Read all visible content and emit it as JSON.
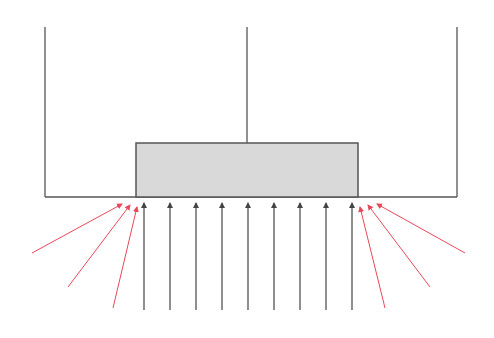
{
  "diagram": {
    "colors": {
      "background": "#ffffff",
      "structure": "#555555",
      "block_fill": "#d9d9d9",
      "block_stroke": "#555555",
      "vertical_arrow": "#444444",
      "oblique_arrow": "#e8485a"
    },
    "container": {
      "left_wall": {
        "x": 45,
        "y1": 27,
        "y2": 197
      },
      "right_wall": {
        "x": 457,
        "y1": 27,
        "y2": 197
      },
      "center_line": {
        "x": 247,
        "y1": 27,
        "y2": 143
      },
      "base": {
        "x1": 45,
        "x2": 457,
        "y": 197
      }
    },
    "block": {
      "x": 136,
      "y": 143,
      "width": 222,
      "height": 54
    },
    "vertical_arrows": [
      {
        "x": 144,
        "y_start": 310,
        "y_tip": 203
      },
      {
        "x": 170,
        "y_start": 310,
        "y_tip": 203
      },
      {
        "x": 196,
        "y_start": 310,
        "y_tip": 203
      },
      {
        "x": 222,
        "y_start": 310,
        "y_tip": 203
      },
      {
        "x": 248,
        "y_start": 310,
        "y_tip": 203
      },
      {
        "x": 274,
        "y_start": 310,
        "y_tip": 203
      },
      {
        "x": 300,
        "y_start": 310,
        "y_tip": 203
      },
      {
        "x": 326,
        "y_start": 310,
        "y_tip": 203
      },
      {
        "x": 352,
        "y_start": 310,
        "y_tip": 203
      }
    ],
    "oblique_arrows_left": [
      {
        "x1": 32,
        "y1": 253,
        "x2": 122,
        "y2": 204
      },
      {
        "x1": 68,
        "y1": 287,
        "x2": 130,
        "y2": 205
      },
      {
        "x1": 113,
        "y1": 308,
        "x2": 137,
        "y2": 207
      }
    ],
    "oblique_arrows_right": [
      {
        "x1": 385,
        "y1": 308,
        "x2": 360,
        "y2": 207
      },
      {
        "x1": 430,
        "y1": 287,
        "x2": 368,
        "y2": 205
      },
      {
        "x1": 465,
        "y1": 253,
        "x2": 377,
        "y2": 204
      }
    ]
  }
}
